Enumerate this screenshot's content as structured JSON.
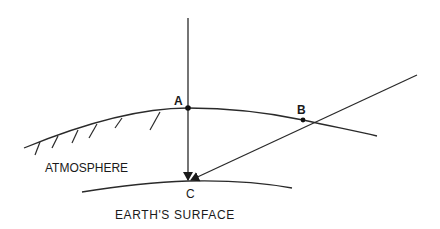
{
  "diagram": {
    "type": "atmospheric-refraction-geometry",
    "points": [
      {
        "id": "A",
        "label": "A",
        "x": 188,
        "y": 108
      },
      {
        "id": "B",
        "label": "B",
        "x": 303,
        "y": 120
      },
      {
        "id": "C",
        "label": "C",
        "x": 188,
        "y": 182
      }
    ],
    "labels": {
      "point_a": "A",
      "point_b": "B",
      "point_c": "C",
      "atmosphere": "ATMOSPHERE",
      "earth_surface": "EARTH'S SURFACE"
    },
    "rays": [
      {
        "name": "vertical-ray",
        "from": [
          188,
          18
        ],
        "through": "A",
        "to": "C"
      },
      {
        "name": "oblique-ray",
        "from": [
          417,
          75
        ],
        "through": "B",
        "to": "C"
      }
    ],
    "curves": [
      {
        "name": "atmosphere-boundary"
      },
      {
        "name": "earth-surface"
      }
    ],
    "colors": {
      "line": "#2a2a2a",
      "text": "#1a1a1a",
      "background": "#ffffff"
    }
  }
}
